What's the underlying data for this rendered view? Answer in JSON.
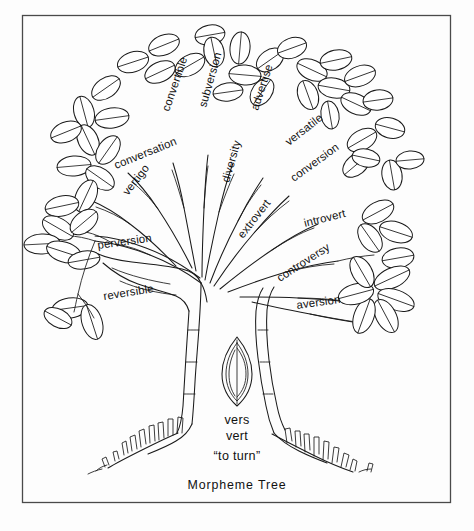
{
  "figure": {
    "caption": "Morpheme Tree",
    "root_morphemes": {
      "line1": "vers",
      "line2": "vert",
      "gloss": "“to turn”"
    },
    "frame": {
      "border_color": "#4a4a4a",
      "background_color": "#fdfdfd",
      "ink_color": "#1a1a1a"
    },
    "branch_labels": [
      {
        "id": "reversible",
        "text": "reversible",
        "x": 104,
        "y": 300,
        "rotate": -9,
        "side": "left"
      },
      {
        "id": "perversion",
        "text": "perversion",
        "x": 98,
        "y": 249,
        "rotate": -8,
        "side": "left"
      },
      {
        "id": "vertigo",
        "text": "vertigo",
        "x": 128,
        "y": 196,
        "rotate": -52,
        "side": "left"
      },
      {
        "id": "conversation",
        "text": "conversation",
        "x": 116,
        "y": 169,
        "rotate": -22,
        "side": "left"
      },
      {
        "id": "convertible",
        "text": "convertible",
        "x": 169,
        "y": 112,
        "rotate": -71,
        "side": "left"
      },
      {
        "id": "subversion",
        "text": "subversion",
        "x": 206,
        "y": 108,
        "rotate": -74,
        "side": "center"
      },
      {
        "id": "diversity",
        "text": "diversity",
        "x": 229,
        "y": 183,
        "rotate": -74,
        "side": "center"
      },
      {
        "id": "advertise",
        "text": "advertise",
        "x": 258,
        "y": 111,
        "rotate": -72,
        "side": "center"
      },
      {
        "id": "extrovert",
        "text": "extrovert",
        "x": 243,
        "y": 239,
        "rotate": -52,
        "side": "right"
      },
      {
        "id": "versatile",
        "text": "versatile",
        "x": 289,
        "y": 146,
        "rotate": -38,
        "side": "right"
      },
      {
        "id": "conversion",
        "text": "conversion",
        "x": 294,
        "y": 182,
        "rotate": -36,
        "side": "right"
      },
      {
        "id": "introvert",
        "text": "introvert",
        "x": 305,
        "y": 227,
        "rotate": -14,
        "side": "right"
      },
      {
        "id": "controversy",
        "text": "controversy",
        "x": 280,
        "y": 282,
        "rotate": -33,
        "side": "right"
      },
      {
        "id": "aversion",
        "text": "aversion",
        "x": 297,
        "y": 309,
        "rotate": -8,
        "side": "right"
      }
    ],
    "icons": [
      {
        "name": "seed-icon"
      },
      {
        "name": "tree-trunk-icon"
      },
      {
        "name": "grass-tuft-left-icon"
      },
      {
        "name": "grass-tuft-right-icon"
      }
    ]
  }
}
